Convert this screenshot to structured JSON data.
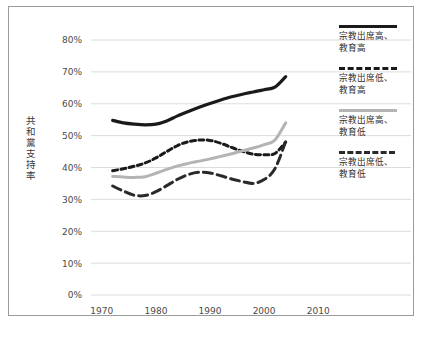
{
  "chart_data": {
    "type": "line",
    "title": "",
    "xlabel": "",
    "ylabel": "共和黨支持率",
    "xlim": [
      1968,
      2012
    ],
    "ylim": [
      0,
      80
    ],
    "grid": true,
    "legend_position": "right",
    "x_ticks": [
      "1970",
      "1980",
      "1990",
      "2000",
      "2010"
    ],
    "x_tick_values": [
      1970,
      1980,
      1990,
      2000,
      2010
    ],
    "y_ticks": [
      "0%",
      "10%",
      "20%",
      "30%",
      "40%",
      "50%",
      "60%",
      "70%",
      "80%"
    ],
    "y_tick_values": [
      0,
      10,
      20,
      30,
      40,
      50,
      60,
      70,
      80
    ],
    "series": [
      {
        "name": "宗教出席高、教育高",
        "legend_label": "宗教出席高、\n教育高",
        "style": "solid",
        "color": "#1a1a1a",
        "width": 3.2,
        "x": [
          1972,
          1974,
          1976,
          1978,
          1980,
          1982,
          1984,
          1986,
          1988,
          1990,
          1992,
          1994,
          1996,
          1998,
          2000,
          2002,
          2004
        ],
        "values": [
          54.8,
          54.0,
          53.6,
          53.4,
          53.6,
          54.6,
          56.2,
          57.6,
          58.9,
          60.1,
          61.2,
          62.2,
          63.0,
          63.7,
          64.4,
          65.2,
          68.5
        ]
      },
      {
        "name": "宗教出席低、教育高",
        "legend_label": "宗教出席低、\n教育高",
        "style": "dashed-short",
        "color": "#1a1a1a",
        "width": 3.0,
        "x": [
          1972,
          1974,
          1976,
          1978,
          1980,
          1982,
          1984,
          1986,
          1988,
          1990,
          1992,
          1994,
          1996,
          1998,
          2000,
          2002,
          2004
        ],
        "values": [
          39.0,
          39.6,
          40.4,
          41.4,
          43.0,
          45.0,
          46.9,
          48.1,
          48.6,
          48.5,
          47.6,
          46.3,
          45.1,
          44.2,
          44.0,
          44.4,
          48.0
        ]
      },
      {
        "name": "宗教出席高、教育低",
        "legend_label": "宗教出席高、\n教育低",
        "style": "solid",
        "color": "#b4b4b4",
        "width": 3.0,
        "x": [
          1972,
          1974,
          1976,
          1978,
          1980,
          1982,
          1984,
          1986,
          1988,
          1990,
          1992,
          1994,
          1996,
          1998,
          2000,
          2002,
          2004
        ],
        "values": [
          37.2,
          37.0,
          36.9,
          37.1,
          38.2,
          39.4,
          40.5,
          41.3,
          42.0,
          42.7,
          43.5,
          44.3,
          45.2,
          46.1,
          47.2,
          48.6,
          54.0
        ]
      },
      {
        "name": "宗教出席低、教育低",
        "legend_label": "宗教出席低、\n教育低",
        "style": "dashed-long",
        "color": "#2a2a2a",
        "width": 3.0,
        "x": [
          1972,
          1974,
          1976,
          1978,
          1980,
          1982,
          1984,
          1986,
          1988,
          1990,
          1992,
          1994,
          1996,
          1998,
          2000,
          2002,
          2004
        ],
        "values": [
          34.2,
          32.6,
          31.3,
          31.2,
          32.4,
          34.3,
          36.3,
          37.8,
          38.5,
          38.3,
          37.4,
          36.4,
          35.6,
          35.0,
          36.2,
          39.6,
          48.2
        ]
      }
    ]
  },
  "axis": {
    "y_title_chars": [
      "共",
      "和",
      "黨",
      "支",
      "持",
      "率"
    ]
  }
}
